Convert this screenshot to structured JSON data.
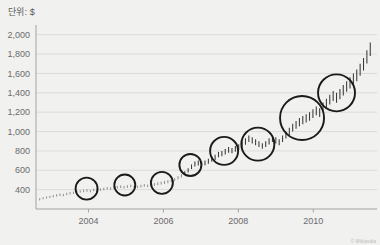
{
  "unit_label": "단위: $",
  "credit": "© Wikipedia",
  "chart_data": {
    "type": "line",
    "title": "",
    "subtitle": "",
    "xlabel": "",
    "ylabel": "단위: $",
    "grid": true,
    "legend": "none",
    "xlim": [
      2002.6,
      2011.7
    ],
    "ylim": [
      200,
      2080
    ],
    "yticks": [
      400,
      600,
      800,
      1000,
      1200,
      1400,
      1600,
      1800,
      2000
    ],
    "ytick_labels": [
      "400",
      "600",
      "800",
      "1,000",
      "1,200",
      "1,400",
      "1,600",
      "1,800",
      "2,000"
    ],
    "xticks": [
      2004,
      2006,
      2008,
      2010
    ],
    "xtick_labels": [
      "2004",
      "2006",
      "2008",
      "2010"
    ],
    "series": [
      {
        "name": "price",
        "marker": "ohlc-bar",
        "color": "#3a3a3c",
        "x": [
          2002.7,
          2002.79,
          2002.88,
          2002.97,
          2003.06,
          2003.15,
          2003.24,
          2003.33,
          2003.42,
          2003.51,
          2003.6,
          2003.69,
          2003.78,
          2003.87,
          2003.96,
          2004.05,
          2004.14,
          2004.23,
          2004.32,
          2004.41,
          2004.5,
          2004.59,
          2004.68,
          2004.77,
          2004.86,
          2004.95,
          2005.04,
          2005.13,
          2005.22,
          2005.31,
          2005.4,
          2005.49,
          2005.58,
          2005.67,
          2005.76,
          2005.85,
          2005.94,
          2006.03,
          2006.12,
          2006.21,
          2006.3,
          2006.39,
          2006.48,
          2006.57,
          2006.66,
          2006.75,
          2006.84,
          2006.93,
          2007.02,
          2007.11,
          2007.2,
          2007.29,
          2007.38,
          2007.47,
          2007.56,
          2007.65,
          2007.74,
          2007.83,
          2007.92,
          2008.01,
          2008.1,
          2008.19,
          2008.28,
          2008.37,
          2008.46,
          2008.55,
          2008.64,
          2008.73,
          2008.82,
          2008.91,
          2009.0,
          2009.09,
          2009.18,
          2009.27,
          2009.36,
          2009.45,
          2009.54,
          2009.63,
          2009.72,
          2009.81,
          2009.9,
          2009.99,
          2010.08,
          2010.17,
          2010.26,
          2010.35,
          2010.44,
          2010.53,
          2010.62,
          2010.71,
          2010.8,
          2010.89,
          2010.98,
          2011.07,
          2011.16,
          2011.25,
          2011.34,
          2011.43,
          2011.52
        ],
        "high": [
          312,
          322,
          330,
          336,
          344,
          352,
          360,
          356,
          368,
          376,
          380,
          388,
          394,
          400,
          404,
          398,
          410,
          418,
          412,
          420,
          428,
          424,
          432,
          440,
          444,
          438,
          446,
          452,
          446,
          440,
          450,
          458,
          452,
          460,
          468,
          476,
          482,
          490,
          498,
          506,
          520,
          540,
          560,
          590,
          620,
          660,
          690,
          700,
          690,
          700,
          720,
          740,
          760,
          790,
          800,
          820,
          840,
          830,
          850,
          870,
          900,
          930,
          960,
          940,
          920,
          900,
          880,
          900,
          930,
          960,
          940,
          920,
          960,
          1000,
          1040,
          1080,
          1110,
          1140,
          1160,
          1180,
          1200,
          1230,
          1260,
          1240,
          1300,
          1340,
          1380,
          1420,
          1400,
          1440,
          1480,
          1520,
          1560,
          1600,
          1640,
          1700,
          1760,
          1840,
          1920
        ],
        "low": [
          288,
          300,
          308,
          314,
          320,
          328,
          334,
          332,
          342,
          350,
          356,
          362,
          368,
          374,
          378,
          372,
          384,
          392,
          388,
          394,
          400,
          398,
          406,
          412,
          416,
          412,
          418,
          424,
          420,
          416,
          422,
          430,
          426,
          432,
          438,
          446,
          452,
          458,
          466,
          474,
          488,
          506,
          524,
          550,
          578,
          612,
          640,
          650,
          644,
          652,
          668,
          688,
          706,
          734,
          746,
          764,
          782,
          776,
          792,
          810,
          836,
          864,
          892,
          876,
          858,
          840,
          822,
          840,
          866,
          892,
          876,
          858,
          892,
          928,
          964,
          1000,
          1028,
          1056,
          1076,
          1094,
          1112,
          1140,
          1168,
          1150,
          1204,
          1242,
          1280,
          1316,
          1298,
          1334,
          1372,
          1410,
          1446,
          1484,
          1520,
          1576,
          1630,
          1704,
          1780
        ]
      }
    ],
    "annotations": [
      {
        "label": "halving-1",
        "x": 2003.95,
        "y": 410,
        "r_px": 11
      },
      {
        "label": "halving-2",
        "x": 2004.97,
        "y": 448,
        "r_px": 10.5
      },
      {
        "label": "halving-3",
        "x": 2005.96,
        "y": 470,
        "r_px": 11
      },
      {
        "label": "halving-4",
        "x": 2006.72,
        "y": 655,
        "r_px": 11
      },
      {
        "label": "halving-5",
        "x": 2007.62,
        "y": 800,
        "r_px": 14
      },
      {
        "label": "halving-6",
        "x": 2008.52,
        "y": 870,
        "r_px": 16.5
      },
      {
        "label": "halving-7",
        "x": 2009.7,
        "y": 1140,
        "r_px": 22
      },
      {
        "label": "halving-8",
        "x": 2010.62,
        "y": 1400,
        "r_px": 18.5
      }
    ]
  }
}
